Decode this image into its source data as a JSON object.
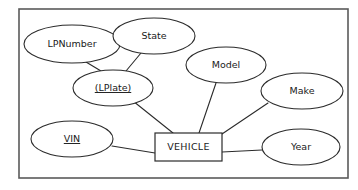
{
  "diagram": {
    "type": "er-diagram",
    "frame": {
      "x": 19,
      "y": 9,
      "width": 329,
      "height": 169,
      "stroke_color": "#5a5a5a"
    },
    "stroke_color": "#2b2b2b",
    "fill_color": "#ffffff",
    "background_color": "#ffffff",
    "entity": {
      "label": "VEHICLE",
      "shape": "rectangle",
      "x": 155,
      "y": 133,
      "width": 67,
      "height": 28
    },
    "attributes": [
      {
        "id": "lpnumber",
        "label": "LPNumber",
        "shape": "ellipse",
        "cx": 72,
        "cy": 44,
        "rx": 48,
        "ry": 19,
        "underlined": false
      },
      {
        "id": "state",
        "label": "State",
        "shape": "ellipse",
        "cx": 154,
        "cy": 36,
        "rx": 41,
        "ry": 18,
        "underlined": false
      },
      {
        "id": "lplate",
        "label": "(LPlate)",
        "shape": "ellipse",
        "cx": 113,
        "cy": 88,
        "rx": 40,
        "ry": 18,
        "underlined": true
      },
      {
        "id": "model",
        "label": "Model",
        "shape": "ellipse",
        "cx": 226,
        "cy": 65,
        "rx": 40,
        "ry": 18,
        "underlined": false
      },
      {
        "id": "make",
        "label": "Make",
        "shape": "ellipse",
        "cx": 302,
        "cy": 91,
        "rx": 41,
        "ry": 18,
        "underlined": false
      },
      {
        "id": "vin",
        "label": "VIN",
        "shape": "ellipse",
        "cx": 72,
        "cy": 139,
        "rx": 41,
        "ry": 18,
        "underlined": true
      },
      {
        "id": "year",
        "label": "Year",
        "shape": "ellipse",
        "cx": 301,
        "cy": 147,
        "rx": 39,
        "ry": 18,
        "underlined": false
      }
    ],
    "connections": [
      {
        "id": "lpnumber-lplate",
        "from": "LPNumber",
        "to": "(LPlate)",
        "x1": 86,
        "y1": 62,
        "x2": 101,
        "y2": 71
      },
      {
        "id": "state-lplate",
        "from": "State",
        "to": "(LPlate)",
        "x1": 141,
        "y1": 53,
        "x2": 126,
        "y2": 71
      },
      {
        "id": "lplate-vehicle",
        "from": "(LPlate)",
        "to": "VEHICLE",
        "x1": 133,
        "y1": 101,
        "x2": 173,
        "y2": 133
      },
      {
        "id": "model-vehicle",
        "from": "Model",
        "to": "VEHICLE",
        "x1": 216,
        "y1": 83,
        "x2": 199,
        "y2": 133
      },
      {
        "id": "make-vehicle",
        "from": "Make",
        "to": "VEHICLE",
        "x1": 268,
        "y1": 103,
        "x2": 222,
        "y2": 134
      },
      {
        "id": "vin-vehicle",
        "from": "VIN",
        "to": "VEHICLE",
        "x1": 112,
        "y1": 146,
        "x2": 155,
        "y2": 153
      },
      {
        "id": "year-vehicle",
        "from": "Year",
        "to": "VEHICLE",
        "x1": 262,
        "y1": 150,
        "x2": 222,
        "y2": 152
      }
    ]
  }
}
